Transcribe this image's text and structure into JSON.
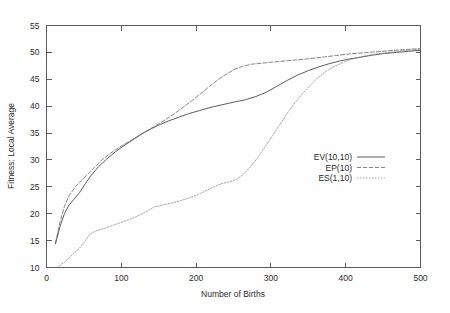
{
  "figure": {
    "background_color": "#fefefe",
    "frame_color": "#5a5a5a",
    "text_color": "#2b2b2b"
  },
  "chart_data": {
    "type": "line",
    "title": "",
    "xlabel": "Number of Births",
    "ylabel": "Fitness: Local Average",
    "xlim": [
      0,
      500
    ],
    "ylim": [
      10,
      55
    ],
    "xticks": [
      0,
      100,
      200,
      300,
      400,
      500
    ],
    "yticks": [
      10,
      15,
      20,
      25,
      30,
      35,
      40,
      45,
      50,
      55
    ],
    "xtick_labels": [
      "0",
      "100",
      "200",
      "300",
      "400",
      "500"
    ],
    "ytick_labels": [
      "10",
      "15",
      "20",
      "25",
      "30",
      "35",
      "40",
      "45",
      "50",
      "55"
    ],
    "grid": false,
    "legend_position": "center-right",
    "series": [
      {
        "name": "EV(10,10)",
        "style": "solid",
        "color": "#4a4a4a",
        "dash": "none",
        "points": [
          [
            12,
            14.4
          ],
          [
            18,
            17.6
          ],
          [
            24,
            20.0
          ],
          [
            30,
            21.6
          ],
          [
            36,
            22.6
          ],
          [
            44,
            23.9
          ],
          [
            52,
            25.6
          ],
          [
            60,
            27.2
          ],
          [
            70,
            28.8
          ],
          [
            80,
            30.1
          ],
          [
            92,
            31.5
          ],
          [
            104,
            32.7
          ],
          [
            116,
            33.8
          ],
          [
            128,
            34.9
          ],
          [
            140,
            35.8
          ],
          [
            152,
            36.6
          ],
          [
            164,
            37.3
          ],
          [
            176,
            37.9
          ],
          [
            190,
            38.6
          ],
          [
            205,
            39.2
          ],
          [
            220,
            39.8
          ],
          [
            236,
            40.3
          ],
          [
            252,
            40.8
          ],
          [
            266,
            41.2
          ],
          [
            280,
            41.8
          ],
          [
            294,
            42.6
          ],
          [
            308,
            43.7
          ],
          [
            322,
            44.8
          ],
          [
            336,
            45.8
          ],
          [
            350,
            46.6
          ],
          [
            364,
            47.3
          ],
          [
            378,
            47.9
          ],
          [
            392,
            48.4
          ],
          [
            406,
            48.8
          ],
          [
            420,
            49.1
          ],
          [
            436,
            49.5
          ],
          [
            452,
            49.8
          ],
          [
            468,
            50.0
          ],
          [
            484,
            50.2
          ],
          [
            500,
            50.4
          ]
        ]
      },
      {
        "name": "EP(10)",
        "style": "dashed",
        "color": "#666666",
        "dash": "4,2",
        "points": [
          [
            12,
            14.6
          ],
          [
            18,
            18.4
          ],
          [
            24,
            21.4
          ],
          [
            30,
            23.3
          ],
          [
            38,
            24.9
          ],
          [
            46,
            26.1
          ],
          [
            54,
            27.2
          ],
          [
            64,
            28.6
          ],
          [
            74,
            30.0
          ],
          [
            86,
            31.3
          ],
          [
            98,
            32.4
          ],
          [
            110,
            33.4
          ],
          [
            122,
            34.4
          ],
          [
            134,
            35.4
          ],
          [
            146,
            36.4
          ],
          [
            158,
            37.4
          ],
          [
            170,
            38.5
          ],
          [
            182,
            39.7
          ],
          [
            194,
            41.0
          ],
          [
            206,
            42.3
          ],
          [
            218,
            43.7
          ],
          [
            230,
            45.0
          ],
          [
            242,
            46.1
          ],
          [
            252,
            46.9
          ],
          [
            262,
            47.4
          ],
          [
            274,
            47.8
          ],
          [
            288,
            48.0
          ],
          [
            302,
            48.2
          ],
          [
            318,
            48.4
          ],
          [
            334,
            48.6
          ],
          [
            350,
            48.8
          ],
          [
            368,
            49.1
          ],
          [
            386,
            49.4
          ],
          [
            404,
            49.7
          ],
          [
            422,
            49.9
          ],
          [
            440,
            50.1
          ],
          [
            458,
            50.3
          ],
          [
            476,
            50.5
          ],
          [
            500,
            50.7
          ]
        ]
      },
      {
        "name": "ES(1,10)",
        "style": "dotted",
        "color": "#8a8a8a",
        "dash": "1.4,1.6",
        "points": [
          [
            14,
            10.0
          ],
          [
            24,
            11.0
          ],
          [
            34,
            12.3
          ],
          [
            44,
            13.6
          ],
          [
            52,
            15.0
          ],
          [
            58,
            16.2
          ],
          [
            66,
            16.8
          ],
          [
            76,
            17.2
          ],
          [
            88,
            17.8
          ],
          [
            100,
            18.4
          ],
          [
            112,
            19.0
          ],
          [
            124,
            19.7
          ],
          [
            134,
            20.4
          ],
          [
            144,
            21.3
          ],
          [
            152,
            21.5
          ],
          [
            164,
            21.9
          ],
          [
            176,
            22.3
          ],
          [
            188,
            22.8
          ],
          [
            200,
            23.4
          ],
          [
            212,
            24.2
          ],
          [
            224,
            25.0
          ],
          [
            234,
            25.6
          ],
          [
            244,
            25.9
          ],
          [
            254,
            26.4
          ],
          [
            262,
            27.2
          ],
          [
            272,
            28.6
          ],
          [
            282,
            30.4
          ],
          [
            292,
            32.4
          ],
          [
            302,
            34.5
          ],
          [
            312,
            36.6
          ],
          [
            322,
            38.7
          ],
          [
            332,
            40.6
          ],
          [
            342,
            42.3
          ],
          [
            352,
            43.8
          ],
          [
            362,
            45.2
          ],
          [
            374,
            46.5
          ],
          [
            386,
            47.5
          ],
          [
            398,
            48.2
          ],
          [
            410,
            48.8
          ],
          [
            424,
            49.3
          ],
          [
            440,
            49.7
          ],
          [
            458,
            50.0
          ],
          [
            476,
            50.3
          ],
          [
            500,
            50.6
          ]
        ]
      }
    ]
  },
  "legend": {
    "entries": [
      {
        "label": "EV(10,10)",
        "style": "solid"
      },
      {
        "label": "EP(10)",
        "style": "dashed"
      },
      {
        "label": "ES(1,10)",
        "style": "dotted"
      }
    ]
  }
}
